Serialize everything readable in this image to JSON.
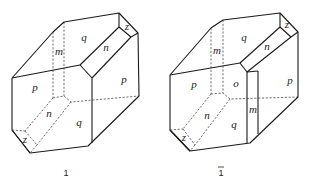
{
  "figure": {
    "crystals": [
      {
        "id": "left",
        "caption": "1",
        "faces": {
          "q_top": "q",
          "m_top": "m",
          "n_top": "n",
          "z_top": "z",
          "p_left": "p",
          "p_right": "p",
          "n_bottom": "n",
          "q_bottom": "q",
          "z_bottom": "z"
        }
      },
      {
        "id": "right",
        "caption": "1",
        "caption_overbar": true,
        "faces": {
          "q_top": "q",
          "m_top": "m",
          "n_top": "n",
          "z_top": "z",
          "p_left": "p",
          "o_center": "o",
          "p_right": "p",
          "m_side": "m",
          "n_bottom": "n",
          "q_bottom": "q",
          "z_bottom": "z"
        }
      }
    ]
  }
}
